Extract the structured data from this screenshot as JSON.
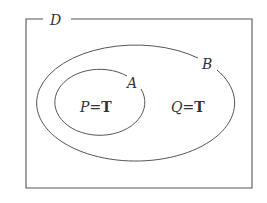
{
  "diagram": {
    "type": "venn",
    "universe": {
      "label": "D"
    },
    "sets": [
      {
        "id": "B",
        "label": "B",
        "region_text": {
          "var": "Q",
          "eq": "=",
          "val": "T"
        }
      },
      {
        "id": "A",
        "label": "A",
        "region_text": {
          "var": "P",
          "eq": "=",
          "val": "T"
        },
        "subset_of": "B"
      }
    ],
    "colors": {
      "stroke": "#555555",
      "text": "#333333",
      "background": "#ffffff"
    }
  }
}
